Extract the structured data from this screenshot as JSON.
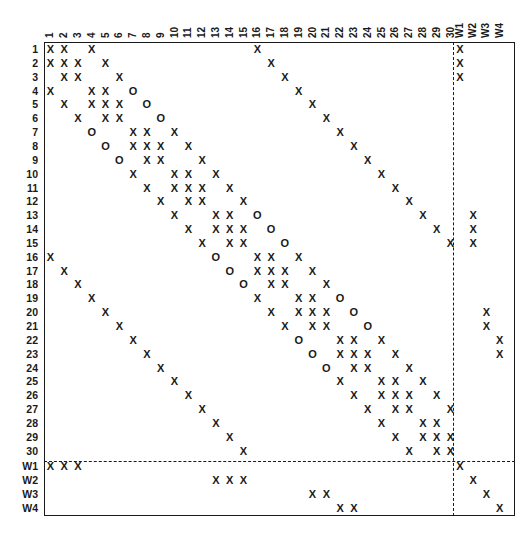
{
  "diagram": {
    "title": "",
    "columns": [
      "1",
      "2",
      "3",
      "4",
      "5",
      "6",
      "7",
      "8",
      "9",
      "10",
      "11",
      "12",
      "13",
      "14",
      "15",
      "16",
      "17",
      "18",
      "19",
      "20",
      "21",
      "22",
      "23",
      "24",
      "25",
      "26",
      "27",
      "28",
      "29",
      "30",
      "W1",
      "W2",
      "W3",
      "W4"
    ],
    "rows": [
      "1",
      "2",
      "3",
      "4",
      "5",
      "6",
      "7",
      "8",
      "9",
      "10",
      "11",
      "12",
      "13",
      "14",
      "15",
      "16",
      "17",
      "18",
      "19",
      "20",
      "21",
      "22",
      "23",
      "24",
      "25",
      "26",
      "27",
      "28",
      "29",
      "30",
      "W1",
      "W2",
      "W3",
      "W4"
    ],
    "legend": {
      "X": "X",
      "O": "O"
    },
    "entries": [
      {
        "row": "1",
        "cells": [
          [
            "1",
            "X"
          ],
          [
            "2",
            "X"
          ],
          [
            "4",
            "X"
          ],
          [
            "16",
            "X"
          ],
          [
            "W1",
            "X"
          ]
        ]
      },
      {
        "row": "2",
        "cells": [
          [
            "1",
            "X"
          ],
          [
            "2",
            "X"
          ],
          [
            "3",
            "X"
          ],
          [
            "5",
            "X"
          ],
          [
            "17",
            "X"
          ],
          [
            "W1",
            "X"
          ]
        ]
      },
      {
        "row": "3",
        "cells": [
          [
            "2",
            "X"
          ],
          [
            "3",
            "X"
          ],
          [
            "6",
            "X"
          ],
          [
            "18",
            "X"
          ],
          [
            "W1",
            "X"
          ]
        ]
      },
      {
        "row": "4",
        "cells": [
          [
            "1",
            "X"
          ],
          [
            "4",
            "X"
          ],
          [
            "5",
            "X"
          ],
          [
            "7",
            "O"
          ],
          [
            "19",
            "X"
          ]
        ]
      },
      {
        "row": "5",
        "cells": [
          [
            "2",
            "X"
          ],
          [
            "4",
            "X"
          ],
          [
            "5",
            "X"
          ],
          [
            "6",
            "X"
          ],
          [
            "8",
            "O"
          ],
          [
            "20",
            "X"
          ]
        ]
      },
      {
        "row": "6",
        "cells": [
          [
            "3",
            "X"
          ],
          [
            "5",
            "X"
          ],
          [
            "6",
            "X"
          ],
          [
            "9",
            "O"
          ],
          [
            "21",
            "X"
          ]
        ]
      },
      {
        "row": "7",
        "cells": [
          [
            "4",
            "O"
          ],
          [
            "7",
            "X"
          ],
          [
            "8",
            "X"
          ],
          [
            "10",
            "X"
          ],
          [
            "22",
            "X"
          ]
        ]
      },
      {
        "row": "8",
        "cells": [
          [
            "5",
            "O"
          ],
          [
            "7",
            "X"
          ],
          [
            "8",
            "X"
          ],
          [
            "9",
            "X"
          ],
          [
            "11",
            "X"
          ],
          [
            "23",
            "X"
          ]
        ]
      },
      {
        "row": "9",
        "cells": [
          [
            "6",
            "O"
          ],
          [
            "8",
            "X"
          ],
          [
            "9",
            "X"
          ],
          [
            "12",
            "X"
          ],
          [
            "24",
            "X"
          ]
        ]
      },
      {
        "row": "10",
        "cells": [
          [
            "7",
            "X"
          ],
          [
            "10",
            "X"
          ],
          [
            "11",
            "X"
          ],
          [
            "13",
            "X"
          ],
          [
            "25",
            "X"
          ]
        ]
      },
      {
        "row": "11",
        "cells": [
          [
            "8",
            "X"
          ],
          [
            "10",
            "X"
          ],
          [
            "11",
            "X"
          ],
          [
            "12",
            "X"
          ],
          [
            "14",
            "X"
          ],
          [
            "26",
            "X"
          ]
        ]
      },
      {
        "row": "12",
        "cells": [
          [
            "9",
            "X"
          ],
          [
            "11",
            "X"
          ],
          [
            "12",
            "X"
          ],
          [
            "15",
            "X"
          ],
          [
            "27",
            "X"
          ]
        ]
      },
      {
        "row": "13",
        "cells": [
          [
            "10",
            "X"
          ],
          [
            "13",
            "X"
          ],
          [
            "14",
            "X"
          ],
          [
            "16",
            "O"
          ],
          [
            "28",
            "X"
          ],
          [
            "W2",
            "X"
          ]
        ]
      },
      {
        "row": "14",
        "cells": [
          [
            "11",
            "X"
          ],
          [
            "13",
            "X"
          ],
          [
            "14",
            "X"
          ],
          [
            "15",
            "X"
          ],
          [
            "17",
            "O"
          ],
          [
            "29",
            "X"
          ],
          [
            "W2",
            "X"
          ]
        ]
      },
      {
        "row": "15",
        "cells": [
          [
            "12",
            "X"
          ],
          [
            "14",
            "X"
          ],
          [
            "15",
            "X"
          ],
          [
            "18",
            "O"
          ],
          [
            "30",
            "X"
          ],
          [
            "W2",
            "X"
          ]
        ]
      },
      {
        "row": "16",
        "cells": [
          [
            "1",
            "X"
          ],
          [
            "13",
            "O"
          ],
          [
            "16",
            "X"
          ],
          [
            "17",
            "X"
          ],
          [
            "19",
            "X"
          ]
        ]
      },
      {
        "row": "17",
        "cells": [
          [
            "2",
            "X"
          ],
          [
            "14",
            "O"
          ],
          [
            "16",
            "X"
          ],
          [
            "17",
            "X"
          ],
          [
            "18",
            "X"
          ],
          [
            "20",
            "X"
          ]
        ]
      },
      {
        "row": "18",
        "cells": [
          [
            "3",
            "X"
          ],
          [
            "15",
            "O"
          ],
          [
            "17",
            "X"
          ],
          [
            "18",
            "X"
          ],
          [
            "21",
            "X"
          ]
        ]
      },
      {
        "row": "19",
        "cells": [
          [
            "4",
            "X"
          ],
          [
            "16",
            "X"
          ],
          [
            "19",
            "X"
          ],
          [
            "20",
            "X"
          ],
          [
            "22",
            "O"
          ]
        ]
      },
      {
        "row": "20",
        "cells": [
          [
            "5",
            "X"
          ],
          [
            "17",
            "X"
          ],
          [
            "19",
            "X"
          ],
          [
            "20",
            "X"
          ],
          [
            "21",
            "X"
          ],
          [
            "23",
            "O"
          ],
          [
            "W3",
            "X"
          ]
        ]
      },
      {
        "row": "21",
        "cells": [
          [
            "6",
            "X"
          ],
          [
            "18",
            "X"
          ],
          [
            "20",
            "X"
          ],
          [
            "21",
            "X"
          ],
          [
            "24",
            "O"
          ],
          [
            "W3",
            "X"
          ]
        ]
      },
      {
        "row": "22",
        "cells": [
          [
            "7",
            "X"
          ],
          [
            "19",
            "O"
          ],
          [
            "22",
            "X"
          ],
          [
            "23",
            "X"
          ],
          [
            "25",
            "X"
          ],
          [
            "W4",
            "X"
          ]
        ]
      },
      {
        "row": "23",
        "cells": [
          [
            "8",
            "X"
          ],
          [
            "20",
            "O"
          ],
          [
            "22",
            "X"
          ],
          [
            "23",
            "X"
          ],
          [
            "24",
            "X"
          ],
          [
            "26",
            "X"
          ],
          [
            "W4",
            "X"
          ]
        ]
      },
      {
        "row": "24",
        "cells": [
          [
            "9",
            "X"
          ],
          [
            "21",
            "O"
          ],
          [
            "23",
            "X"
          ],
          [
            "24",
            "X"
          ],
          [
            "27",
            "X"
          ]
        ]
      },
      {
        "row": "25",
        "cells": [
          [
            "10",
            "X"
          ],
          [
            "22",
            "X"
          ],
          [
            "25",
            "X"
          ],
          [
            "26",
            "X"
          ],
          [
            "28",
            "X"
          ]
        ]
      },
      {
        "row": "26",
        "cells": [
          [
            "11",
            "X"
          ],
          [
            "23",
            "X"
          ],
          [
            "25",
            "X"
          ],
          [
            "26",
            "X"
          ],
          [
            "27",
            "X"
          ],
          [
            "29",
            "X"
          ]
        ]
      },
      {
        "row": "27",
        "cells": [
          [
            "12",
            "X"
          ],
          [
            "24",
            "X"
          ],
          [
            "26",
            "X"
          ],
          [
            "27",
            "X"
          ],
          [
            "30",
            "X"
          ]
        ]
      },
      {
        "row": "28",
        "cells": [
          [
            "13",
            "X"
          ],
          [
            "25",
            "X"
          ],
          [
            "28",
            "X"
          ],
          [
            "29",
            "X"
          ]
        ]
      },
      {
        "row": "29",
        "cells": [
          [
            "14",
            "X"
          ],
          [
            "26",
            "X"
          ],
          [
            "28",
            "X"
          ],
          [
            "29",
            "X"
          ],
          [
            "30",
            "X"
          ]
        ]
      },
      {
        "row": "30",
        "cells": [
          [
            "15",
            "X"
          ],
          [
            "27",
            "X"
          ],
          [
            "29",
            "X"
          ],
          [
            "30",
            "X"
          ]
        ]
      },
      {
        "row": "W1",
        "cells": [
          [
            "1",
            "X"
          ],
          [
            "2",
            "X"
          ],
          [
            "3",
            "X"
          ],
          [
            "W1",
            "X"
          ]
        ]
      },
      {
        "row": "W2",
        "cells": [
          [
            "13",
            "X"
          ],
          [
            "14",
            "X"
          ],
          [
            "15",
            "X"
          ],
          [
            "W2",
            "X"
          ]
        ]
      },
      {
        "row": "W3",
        "cells": [
          [
            "20",
            "X"
          ],
          [
            "21",
            "X"
          ],
          [
            "W3",
            "X"
          ]
        ]
      },
      {
        "row": "W4",
        "cells": [
          [
            "22",
            "X"
          ],
          [
            "23",
            "X"
          ],
          [
            "W4",
            "X"
          ]
        ]
      }
    ],
    "partition": {
      "after_column": "30",
      "after_row": "30",
      "style": "dashed"
    }
  }
}
